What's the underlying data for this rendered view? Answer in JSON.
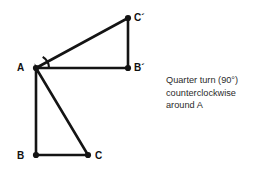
{
  "figure": {
    "background_color": "#ffffff",
    "stroke_color": "#141414",
    "stroke_width": 2.6,
    "point_radius": 3.1,
    "points": {
      "A": {
        "x": 36,
        "y": 68,
        "label": "A",
        "label_x": 17,
        "label_y": 63
      },
      "B": {
        "x": 36,
        "y": 155,
        "label": "B",
        "label_x": 17,
        "label_y": 151
      },
      "C": {
        "x": 88,
        "y": 155,
        "label": "C",
        "label_x": 95,
        "label_y": 151
      },
      "Bp": {
        "x": 128,
        "y": 68,
        "label": "B´",
        "label_x": 134,
        "label_y": 63
      },
      "Cp": {
        "x": 128,
        "y": 18,
        "label": "C´",
        "label_x": 134,
        "label_y": 13
      }
    },
    "triangles": [
      {
        "name": "original-triangle",
        "vertices": [
          "A",
          "B",
          "C"
        ]
      },
      {
        "name": "image-triangle",
        "vertices": [
          "A",
          "Bp",
          "Cp"
        ]
      }
    ],
    "angle_arc": {
      "name": "rotation-angle-arc",
      "center": "A",
      "radius": 13,
      "start_angle_deg": -59,
      "end_angle_deg": 0,
      "description": "arc from ray A-C to ray A-B' marking the quarter turn"
    }
  },
  "caption": {
    "line1": "Quarter turn (90°)",
    "line2": "counterclockwise",
    "line3": "around A",
    "color": "#2b2b2b"
  }
}
